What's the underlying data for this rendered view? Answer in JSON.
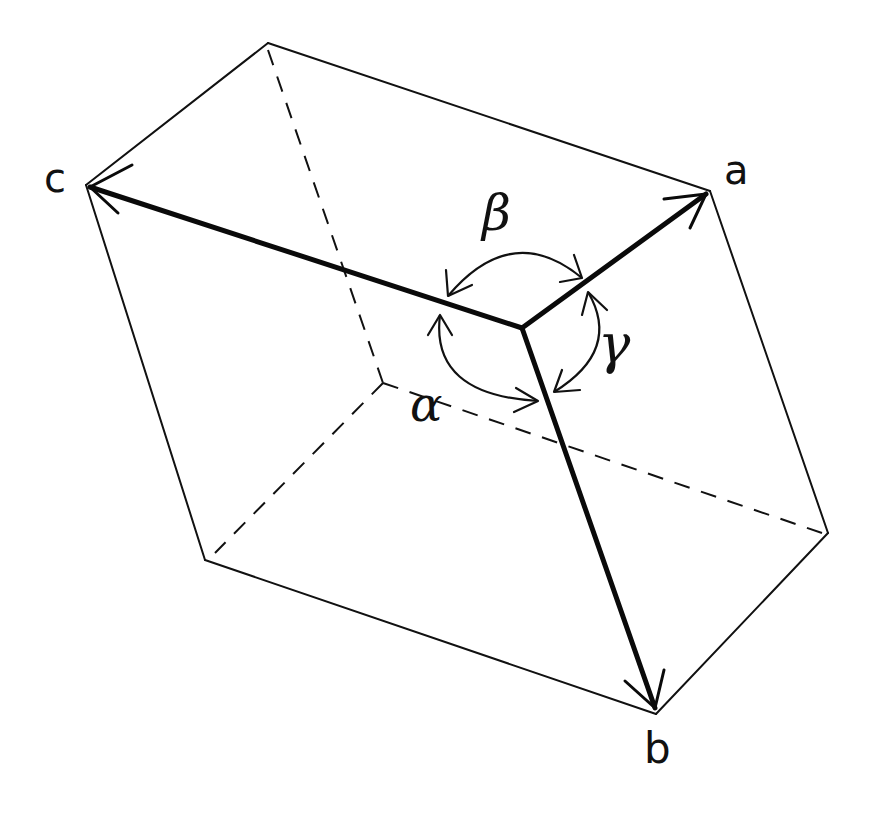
{
  "diagram": {
    "axes": [
      {
        "id": "a",
        "label": "a"
      },
      {
        "id": "b",
        "label": "b"
      },
      {
        "id": "c",
        "label": "c"
      }
    ],
    "angles": [
      {
        "id": "alpha",
        "label": "α",
        "between": [
          "b",
          "c"
        ]
      },
      {
        "id": "beta",
        "label": "β",
        "between": [
          "a",
          "c"
        ]
      },
      {
        "id": "gamma",
        "label": "γ",
        "between": [
          "a",
          "b"
        ]
      }
    ],
    "colors": {
      "line": "#111111",
      "background": "#ffffff"
    }
  }
}
